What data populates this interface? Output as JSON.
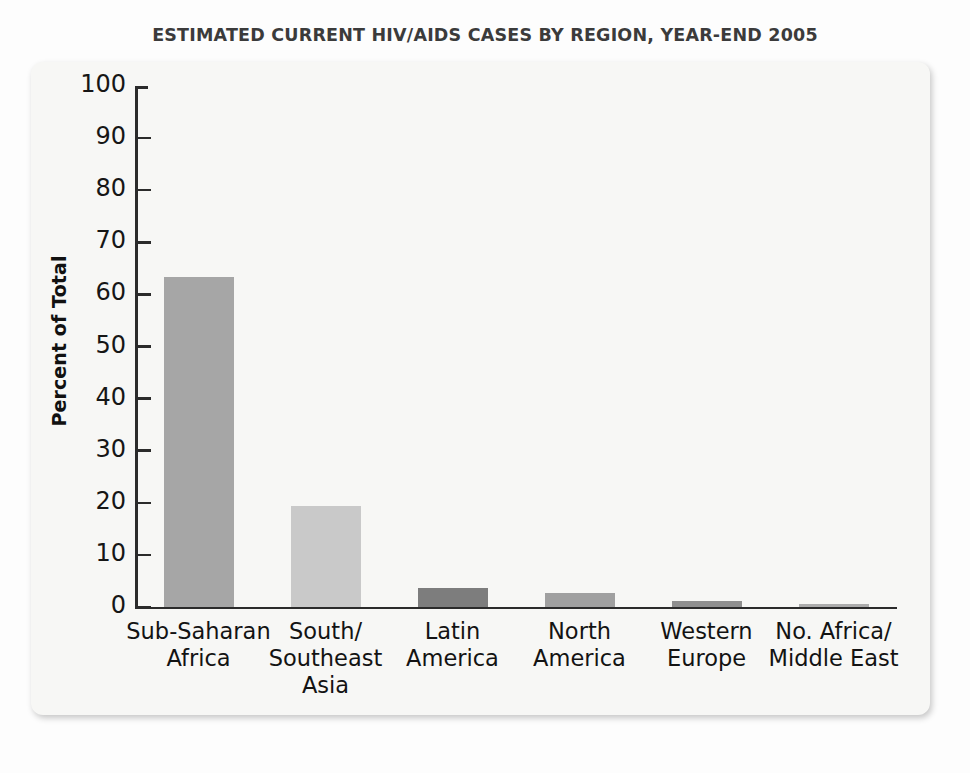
{
  "chart_data": {
    "type": "bar",
    "title": "ESTIMATED CURRENT HIV/AIDS CASES BY REGION, YEAR-END 2005",
    "xlabel": "",
    "ylabel": "Percent of Total",
    "ylim": [
      0,
      100
    ],
    "yticks": [
      0,
      10,
      20,
      30,
      40,
      50,
      60,
      70,
      80,
      90,
      100
    ],
    "ytick_labels": [
      "0",
      "10",
      "20",
      "30",
      "40",
      "50",
      "60",
      "70",
      "80",
      "90",
      "100"
    ],
    "grid": false,
    "legend": "none",
    "categories": [
      "Sub-Saharan\nAfrica",
      "South/\nSoutheast\nAsia",
      "Latin\nAmerica",
      "North\nAmerica",
      "Western\nEurope",
      "No. Africa/\nMiddle East"
    ],
    "values": [
      63.3,
      19.3,
      3.6,
      2.7,
      1.1,
      0.5
    ],
    "bar_colors": [
      "#a6a6a6",
      "#c9c9c9",
      "#7d7d7d",
      "#a0a0a0",
      "#8f8f8f",
      "#adadad"
    ]
  },
  "panel": {
    "background_color": "#f7f7f5",
    "axis_color": "#2b2b2b"
  }
}
